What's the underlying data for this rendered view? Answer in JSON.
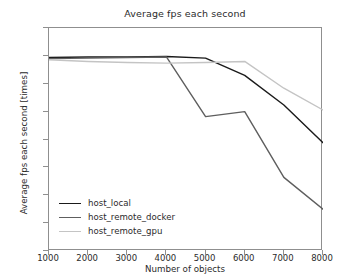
{
  "chart_data": {
    "type": "line",
    "title": "Average fps each second",
    "xlabel": "Number of objects",
    "ylabel": "Average fps each second [times]",
    "x": [
      1000,
      2000,
      3000,
      4000,
      5000,
      6000,
      7000,
      8000
    ],
    "xlim": [
      1000,
      8000
    ],
    "ylim": [
      15,
      55
    ],
    "xticks": [
      "1000",
      "2000",
      "3000",
      "4000",
      "5000",
      "6000",
      "7000",
      "8000"
    ],
    "yticks": [
      "15",
      "20",
      "25",
      "30",
      "35",
      "40",
      "45",
      "50",
      "55"
    ],
    "grid": false,
    "legend_position": "lower left",
    "series": [
      {
        "name": "host_local",
        "color": "#1a1a1a",
        "values": [
          49.7,
          49.8,
          49.8,
          49.9,
          49.6,
          46.5,
          41.2,
          34.4
        ]
      },
      {
        "name": "host_remote_docker",
        "color": "#5e5e5e",
        "values": [
          49.5,
          49.6,
          49.7,
          49.8,
          39.1,
          40.0,
          28.2,
          22.5
        ]
      },
      {
        "name": "host_remote_gpu",
        "color": "#c4c4c4",
        "values": [
          49.3,
          49.0,
          48.8,
          48.7,
          48.8,
          49.0,
          44.2,
          40.3
        ]
      }
    ]
  },
  "legend": {
    "items": [
      {
        "label": "host_local"
      },
      {
        "label": "host_remote_docker"
      },
      {
        "label": "host_remote_gpu"
      }
    ]
  }
}
